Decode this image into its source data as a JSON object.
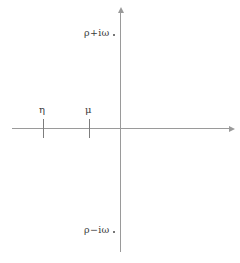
{
  "figure": {
    "background_color": "#ffffff",
    "axis_color": "#9a9a9a",
    "text_color": "#3a3a3a",
    "tick_color": "#7d7d7d"
  },
  "axes": {
    "real_axis": {
      "name": "real-axis",
      "orientation": "horizontal",
      "has_arrowhead": true,
      "arrow_direction": "right"
    },
    "imaginary_axis": {
      "name": "imaginary-axis",
      "orientation": "vertical",
      "has_arrowhead": true,
      "arrow_direction": "up"
    }
  },
  "ticks": [
    {
      "id": "eta",
      "label": "η",
      "axis": "real",
      "side": "negative"
    },
    {
      "id": "mu",
      "label": "μ",
      "axis": "real",
      "side": "negative"
    }
  ],
  "poles": [
    {
      "id": "upper",
      "label": "ρ+iω",
      "position": "upper-half-plane",
      "marker": "dot"
    },
    {
      "id": "lower",
      "label": "ρ−iω",
      "position": "lower-half-plane",
      "marker": "dot"
    }
  ]
}
